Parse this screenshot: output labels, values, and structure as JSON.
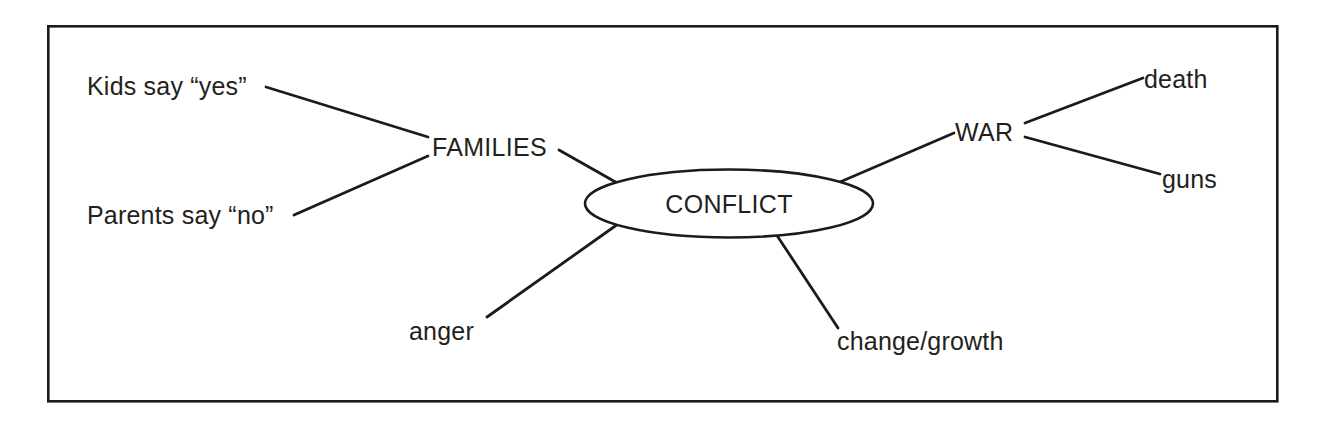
{
  "diagram": {
    "type": "concept-map",
    "frame": {
      "stroke_color": "#1b1b1b",
      "fill_color": "#ffffff"
    },
    "center_node": {
      "label": "CONFLICT",
      "shape": "ellipse"
    },
    "branches": [
      {
        "id": "families",
        "label": "FAMILIES",
        "leaves": [
          {
            "id": "kids-yes",
            "label": "Kids say “yes”"
          },
          {
            "id": "parents-no",
            "label": "Parents say “no”"
          }
        ]
      },
      {
        "id": "war",
        "label": "WAR",
        "leaves": [
          {
            "id": "death",
            "label": "death"
          },
          {
            "id": "guns",
            "label": "guns"
          }
        ]
      }
    ],
    "direct_leaves": [
      {
        "id": "anger",
        "label": "anger"
      },
      {
        "id": "change-growth",
        "label": "change/growth"
      }
    ]
  }
}
